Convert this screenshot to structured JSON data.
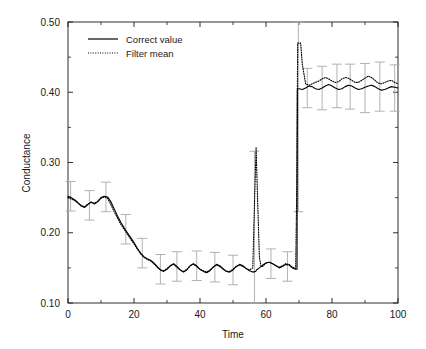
{
  "chart_data": {
    "type": "line",
    "title": "",
    "xlabel": "Time",
    "ylabel": "Conductance",
    "xlim": [
      0,
      100
    ],
    "ylim": [
      0.1,
      0.5
    ],
    "xticks": [
      0,
      20,
      40,
      60,
      80,
      100
    ],
    "xtick_labels": [
      "0",
      "20",
      "40",
      "60",
      "80",
      "100"
    ],
    "xminor_ticks": [
      10,
      30,
      50,
      70,
      90
    ],
    "yticks": [
      0.1,
      0.2,
      0.3,
      0.4,
      0.5
    ],
    "ytick_labels": [
      "0.10",
      "0.20",
      "0.30",
      "0.40",
      "0.50"
    ],
    "yminor_ticks": [
      0.15,
      0.25,
      0.35,
      0.45
    ],
    "grid": false,
    "legend_position": "top-left",
    "legend": [
      {
        "label": "Correct value",
        "style": "solid",
        "color": "#000000"
      },
      {
        "label": "Filter mean",
        "style": "dotted",
        "color": "#000000"
      }
    ],
    "series": [
      {
        "name": "Correct value",
        "style": "solid",
        "color": "#000000",
        "x": [
          0,
          1,
          2,
          3,
          4,
          5,
          6,
          7,
          8,
          9,
          10,
          11,
          12,
          13,
          14,
          15,
          16,
          17,
          18,
          19,
          20,
          21,
          22,
          23,
          24,
          25,
          26,
          27,
          28,
          29,
          30,
          31,
          32,
          33,
          34,
          35,
          36,
          37,
          38,
          39,
          40,
          41,
          42,
          43,
          44,
          45,
          46,
          47,
          48,
          49,
          50,
          51,
          52,
          53,
          54,
          55,
          56,
          56.9,
          57,
          57.1,
          58,
          59,
          60,
          61,
          62,
          63,
          64,
          65,
          66,
          67,
          68,
          69,
          69.4,
          69.5,
          70,
          71,
          72,
          73,
          74,
          75,
          76,
          77,
          78,
          79,
          80,
          81,
          82,
          83,
          84,
          85,
          86,
          87,
          88,
          89,
          90,
          91,
          92,
          93,
          94,
          95,
          96,
          97,
          98,
          99,
          100
        ],
        "y": [
          0.252,
          0.25,
          0.247,
          0.243,
          0.238,
          0.236,
          0.24,
          0.244,
          0.241,
          0.244,
          0.25,
          0.252,
          0.251,
          0.244,
          0.234,
          0.224,
          0.215,
          0.207,
          0.2,
          0.193,
          0.186,
          0.178,
          0.171,
          0.166,
          0.163,
          0.161,
          0.157,
          0.152,
          0.147,
          0.145,
          0.148,
          0.153,
          0.156,
          0.152,
          0.147,
          0.144,
          0.147,
          0.153,
          0.156,
          0.153,
          0.148,
          0.145,
          0.143,
          0.146,
          0.151,
          0.155,
          0.153,
          0.149,
          0.145,
          0.144,
          0.147,
          0.152,
          0.155,
          0.153,
          0.149,
          0.146,
          0.144,
          0.145,
          0.146,
          0.147,
          0.15,
          0.154,
          0.157,
          0.158,
          0.156,
          0.153,
          0.15,
          0.152,
          0.155,
          0.154,
          0.15,
          0.148,
          0.148,
          0.405,
          0.405,
          0.404,
          0.406,
          0.409,
          0.408,
          0.405,
          0.404,
          0.406,
          0.409,
          0.411,
          0.409,
          0.406,
          0.404,
          0.405,
          0.408,
          0.41,
          0.409,
          0.406,
          0.404,
          0.405,
          0.407,
          0.409,
          0.41,
          0.408,
          0.405,
          0.403,
          0.404,
          0.406,
          0.408,
          0.407,
          0.406
        ]
      },
      {
        "name": "Filter mean",
        "style": "dotted",
        "color": "#000000",
        "x": [
          0,
          1,
          2,
          3,
          4,
          5,
          6,
          7,
          8,
          9,
          10,
          11,
          12,
          13,
          14,
          15,
          16,
          17,
          18,
          19,
          20,
          21,
          22,
          23,
          24,
          25,
          26,
          27,
          28,
          29,
          30,
          31,
          32,
          33,
          34,
          35,
          36,
          37,
          38,
          39,
          40,
          41,
          42,
          43,
          44,
          45,
          46,
          47,
          48,
          49,
          50,
          51,
          52,
          53,
          54,
          55,
          56,
          56.5,
          57,
          57.5,
          58,
          58.5,
          59,
          60,
          61,
          62,
          63,
          64,
          65,
          66,
          67,
          68,
          69,
          69.3,
          69.6,
          70,
          70.5,
          71,
          72,
          73,
          74,
          75,
          76,
          77,
          78,
          79,
          80,
          81,
          82,
          83,
          84,
          85,
          86,
          87,
          88,
          89,
          90,
          91,
          92,
          93,
          94,
          95,
          96,
          97,
          98,
          99,
          100
        ],
        "y": [
          0.25,
          0.248,
          0.246,
          0.242,
          0.239,
          0.237,
          0.241,
          0.243,
          0.242,
          0.245,
          0.249,
          0.251,
          0.249,
          0.24,
          0.23,
          0.221,
          0.212,
          0.205,
          0.198,
          0.191,
          0.184,
          0.177,
          0.17,
          0.165,
          0.162,
          0.16,
          0.156,
          0.151,
          0.147,
          0.146,
          0.149,
          0.153,
          0.155,
          0.151,
          0.147,
          0.145,
          0.148,
          0.153,
          0.155,
          0.152,
          0.148,
          0.146,
          0.144,
          0.147,
          0.151,
          0.154,
          0.152,
          0.148,
          0.145,
          0.145,
          0.148,
          0.152,
          0.154,
          0.152,
          0.149,
          0.147,
          0.15,
          0.24,
          0.322,
          0.24,
          0.165,
          0.152,
          0.152,
          0.157,
          0.158,
          0.156,
          0.153,
          0.151,
          0.153,
          0.156,
          0.155,
          0.151,
          0.149,
          0.26,
          0.47,
          0.47,
          0.47,
          0.44,
          0.412,
          0.41,
          0.412,
          0.414,
          0.416,
          0.419,
          0.421,
          0.419,
          0.416,
          0.414,
          0.415,
          0.419,
          0.421,
          0.42,
          0.417,
          0.414,
          0.414,
          0.417,
          0.42,
          0.423,
          0.421,
          0.417,
          0.413,
          0.412,
          0.414,
          0.416,
          0.417,
          0.414,
          0.412
        ]
      }
    ],
    "error_bars": [
      {
        "x": 0.8,
        "y": 0.252,
        "err": 0.021
      },
      {
        "x": 6.5,
        "y": 0.239,
        "err": 0.021
      },
      {
        "x": 11.5,
        "y": 0.251,
        "err": 0.021
      },
      {
        "x": 17.5,
        "y": 0.205,
        "err": 0.021
      },
      {
        "x": 22.5,
        "y": 0.171,
        "err": 0.021
      },
      {
        "x": 28.0,
        "y": 0.148,
        "err": 0.021
      },
      {
        "x": 33.0,
        "y": 0.152,
        "err": 0.021
      },
      {
        "x": 39.0,
        "y": 0.153,
        "err": 0.021
      },
      {
        "x": 44.5,
        "y": 0.151,
        "err": 0.021
      },
      {
        "x": 50.0,
        "y": 0.147,
        "err": 0.021
      },
      {
        "x": 56.5,
        "y": 0.146,
        "err": 0.17
      },
      {
        "x": 61.5,
        "y": 0.156,
        "err": 0.021
      },
      {
        "x": 66.5,
        "y": 0.152,
        "err": 0.021
      },
      {
        "x": 69.8,
        "y": 0.405,
        "err": 0.175
      },
      {
        "x": 72.5,
        "y": 0.406,
        "err": 0.028
      },
      {
        "x": 77.0,
        "y": 0.406,
        "err": 0.031
      },
      {
        "x": 81.5,
        "y": 0.409,
        "err": 0.031
      },
      {
        "x": 85.5,
        "y": 0.408,
        "err": 0.032
      },
      {
        "x": 90.0,
        "y": 0.406,
        "err": 0.035
      },
      {
        "x": 94.5,
        "y": 0.408,
        "err": 0.035
      },
      {
        "x": 99.0,
        "y": 0.406,
        "err": 0.033
      }
    ]
  }
}
